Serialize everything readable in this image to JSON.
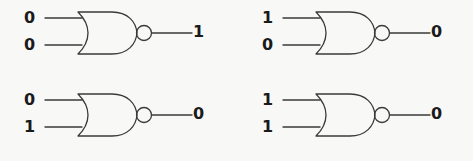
{
  "diagram": {
    "gate_type": "NOR",
    "background_color": "#f8f8f6",
    "line_color": "#3a3a3a",
    "text_color": "#1a1a1a"
  },
  "gates": [
    {
      "id": "gate-top-left",
      "position": "top-left",
      "inputs": [
        "0",
        "0"
      ],
      "output": "1",
      "has_inversion_bubble": true
    },
    {
      "id": "gate-top-right",
      "position": "top-right",
      "inputs": [
        "1",
        "0"
      ],
      "output": "0",
      "has_inversion_bubble": true
    },
    {
      "id": "gate-bottom-left",
      "position": "bottom-left",
      "inputs": [
        "0",
        "1"
      ],
      "output": "0",
      "has_inversion_bubble": true
    },
    {
      "id": "gate-bottom-right",
      "position": "bottom-right",
      "inputs": [
        "1",
        "1"
      ],
      "output": "0",
      "has_inversion_bubble": true
    }
  ]
}
